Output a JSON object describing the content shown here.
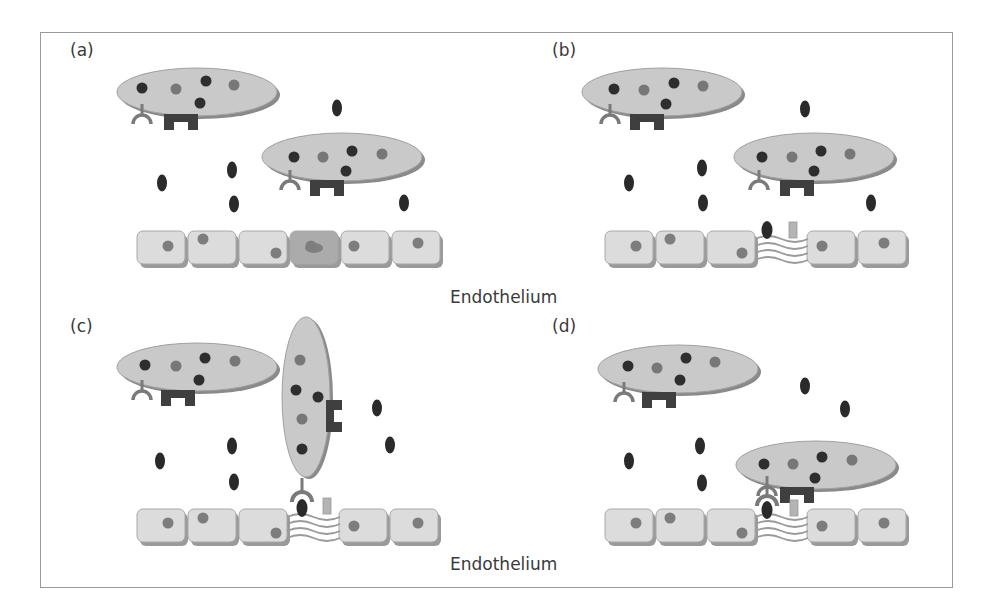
{
  "figure": {
    "colors": {
      "cell_fill": "#c9c9c9",
      "cell_shadow": "#8a8a8a",
      "dot_dark": "#2e2e2e",
      "dot_mid": "#777777",
      "receptor": "#7a7a7a",
      "block": "#3f3f3f",
      "endo_fill": "#dcdcdc",
      "endo_shadow": "#9a9a9a",
      "endo_highlight": "#ababab",
      "molecule": "#2a2a2a",
      "small_rect": "#b4b4b4",
      "wave": "#9a9a9a"
    },
    "panels": [
      {
        "label": "(a)",
        "label_pos": [
          70,
          56
        ],
        "cells": [
          {
            "cx": 197,
            "cy": 92,
            "rx": 80,
            "ry": 24,
            "rot": 0,
            "dots": [
              [
                142,
                88,
                "d"
              ],
              [
                176,
                89,
                "m"
              ],
              [
                206,
                81,
                "d"
              ],
              [
                234,
                85,
                "m"
              ],
              [
                200,
                103,
                "d"
              ]
            ],
            "receptor": [
              142,
              118
            ],
            "block": [
              164,
              114
            ]
          },
          {
            "cx": 342,
            "cy": 157,
            "rx": 80,
            "ry": 24,
            "rot": 0,
            "dots": [
              [
                294,
                157,
                "d"
              ],
              [
                323,
                157,
                "m"
              ],
              [
                352,
                151,
                "d"
              ],
              [
                382,
                154,
                "m"
              ],
              [
                346,
                171,
                "d"
              ]
            ],
            "receptor": [
              290,
              184
            ],
            "block": [
              310,
              180
            ]
          }
        ],
        "molecules": [
          [
            337,
            108
          ],
          [
            162,
            183
          ],
          [
            232,
            170
          ],
          [
            234,
            204
          ],
          [
            404,
            203
          ]
        ],
        "endo": {
          "x": 137,
          "y": 231,
          "cells": 6,
          "highlight": 3,
          "gap": null,
          "dots": [
            [
              168,
              246
            ],
            [
              203,
              239
            ],
            [
              276,
              253
            ],
            [
              311,
              246
            ],
            [
              354,
              246
            ],
            [
              418,
              243
            ]
          ]
        },
        "caption": null
      },
      {
        "label": "(b)",
        "label_pos": [
          552,
          56
        ],
        "cells": [
          {
            "cx": 662,
            "cy": 92,
            "rx": 80,
            "ry": 24,
            "rot": 0,
            "dots": [
              [
                614,
                89,
                "d"
              ],
              [
                644,
                90,
                "m"
              ],
              [
                674,
                83,
                "d"
              ],
              [
                703,
                86,
                "m"
              ],
              [
                666,
                104,
                "d"
              ]
            ],
            "receptor": [
              610,
              118
            ],
            "block": [
              630,
              114
            ]
          },
          {
            "cx": 814,
            "cy": 157,
            "rx": 80,
            "ry": 24,
            "rot": 0,
            "dots": [
              [
                762,
                157,
                "d"
              ],
              [
                792,
                157,
                "m"
              ],
              [
                821,
                151,
                "d"
              ],
              [
                850,
                154,
                "m"
              ],
              [
                814,
                171,
                "d"
              ]
            ],
            "receptor": [
              759,
              184
            ],
            "block": [
              780,
              180
            ]
          }
        ],
        "molecules": [
          [
            805,
            109
          ],
          [
            629,
            183
          ],
          [
            702,
            168
          ],
          [
            703,
            203
          ],
          [
            871,
            203
          ]
        ],
        "endo": {
          "x": 605,
          "y": 231,
          "cells": 5,
          "highlight": null,
          "gap": {
            "after": 3,
            "width": 50
          },
          "dots": [
            [
              636,
              246
            ],
            [
              670,
              239
            ],
            [
              742,
              253
            ],
            [
              822,
              246
            ],
            [
              884,
              243
            ]
          ]
        },
        "gap_items": {
          "molecule": [
            767,
            230
          ],
          "rect": [
            793,
            230
          ]
        },
        "caption": {
          "text_key": "endothelium_1",
          "pos": [
            450,
            304
          ]
        }
      },
      {
        "label": "(c)",
        "label_pos": [
          70,
          330
        ],
        "cells": [
          {
            "cx": 197,
            "cy": 367,
            "rx": 80,
            "ry": 24,
            "rot": 0,
            "dots": [
              [
                145,
                365,
                "d"
              ],
              [
                176,
                366,
                "m"
              ],
              [
                205,
                358,
                "d"
              ],
              [
                235,
                361,
                "m"
              ],
              [
                199,
                380,
                "d"
              ]
            ],
            "receptor": [
              142,
              394
            ],
            "block": [
              161,
              390
            ]
          }
        ],
        "vertical_cell": {
          "cx": 306,
          "cy": 397,
          "rx": 24,
          "ry": 80,
          "dots": [
            [
              300,
              360,
              "m"
            ],
            [
              296,
              390,
              "d"
            ],
            [
              318,
              397,
              "d"
            ],
            [
              302,
              419,
              "m"
            ],
            [
              302,
              449,
              "d"
            ]
          ],
          "block": [
            326,
            400
          ]
        },
        "molecules": [
          [
            377,
            408
          ],
          [
            390,
            445
          ],
          [
            232,
            446
          ],
          [
            234,
            482
          ],
          [
            160,
            461
          ]
        ],
        "endo": {
          "x": 137,
          "y": 509,
          "cells": 5,
          "highlight": null,
          "gap": {
            "after": 3,
            "width": 50
          },
          "dots": [
            [
              168,
              523
            ],
            [
              203,
              518
            ],
            [
              276,
              533
            ],
            [
              354,
              526
            ],
            [
              418,
              523
            ]
          ]
        },
        "gap_items": {
          "molecule": [
            302,
            508
          ],
          "rect": [
            327,
            506
          ],
          "bound_receptor": [
            302,
            496
          ]
        },
        "caption": {
          "text_key": "endothelium_2",
          "pos": [
            450,
            565
          ]
        }
      },
      {
        "label": "(d)",
        "label_pos": [
          552,
          330
        ],
        "cells": [
          {
            "cx": 678,
            "cy": 369,
            "rx": 80,
            "ry": 24,
            "rot": 0,
            "dots": [
              [
                628,
                366,
                "d"
              ],
              [
                657,
                368,
                "m"
              ],
              [
                686,
                358,
                "d"
              ],
              [
                715,
                362,
                "m"
              ],
              [
                680,
                380,
                "d"
              ]
            ],
            "receptor": [
              624,
              396
            ],
            "block": [
              642,
              392
            ]
          },
          {
            "cx": 816,
            "cy": 465,
            "rx": 80,
            "ry": 24,
            "rot": 0,
            "dots": [
              [
                764,
                464,
                "d"
              ],
              [
                793,
                464,
                "m"
              ],
              [
                822,
                457,
                "d"
              ],
              [
                852,
                460,
                "m"
              ],
              [
                815,
                478,
                "d"
              ]
            ],
            "receptor": [
              767,
              490
            ],
            "block": [
              780,
              487
            ]
          }
        ],
        "molecules": [
          [
            805,
            386
          ],
          [
            845,
            409
          ],
          [
            700,
            446
          ],
          [
            702,
            483
          ],
          [
            629,
            461
          ]
        ],
        "endo": {
          "x": 605,
          "y": 509,
          "cells": 5,
          "highlight": null,
          "gap": {
            "after": 3,
            "width": 50
          },
          "dots": [
            [
              636,
              523
            ],
            [
              670,
              518
            ],
            [
              742,
              533
            ],
            [
              822,
              526
            ],
            [
              884,
              523
            ]
          ]
        },
        "gap_items": {
          "molecule": [
            767,
            510
          ],
          "rect": [
            794,
            508
          ],
          "bound_receptor": [
            767,
            500
          ]
        },
        "caption": null
      }
    ]
  },
  "text": {
    "label_a": "(a)",
    "label_b": "(b)",
    "label_c": "(c)",
    "label_d": "(d)",
    "endothelium_1": "Endothelium",
    "endothelium_2": "Endothelium"
  }
}
